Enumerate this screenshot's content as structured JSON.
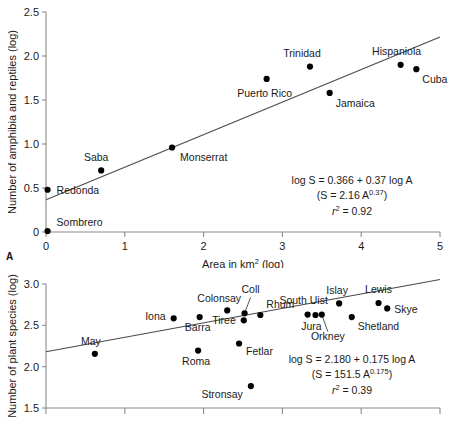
{
  "figure": {
    "panel_a_label": "A",
    "background": "#ffffff",
    "dot_color": "#000000",
    "line_color": "#4a4a4a",
    "axis_color": "#8a8a8a"
  },
  "chart_data": [
    {
      "id": "panel-a",
      "type": "scatter",
      "panel_label": "A",
      "title": "",
      "xlabel": "Area in km2 (log)",
      "xlabel_parts": {
        "pre": "Area in km",
        "sup": "2",
        "post": " (log)"
      },
      "ylabel": "Number of amphibia and reptiles (log)",
      "xlim": [
        0,
        5
      ],
      "ylim": [
        0,
        2.5
      ],
      "xticks": [
        0,
        1,
        2,
        3,
        4,
        5
      ],
      "xticklabels": [
        "0",
        "1",
        "2",
        "3",
        "4",
        "5"
      ],
      "yticks": [
        0,
        0.5,
        1.0,
        1.5,
        2.0,
        2.5
      ],
      "yticklabels": [
        "0",
        "0.5",
        "1.0",
        "1.5",
        "2.0",
        "2.5"
      ],
      "grid": false,
      "legend": "none",
      "points": [
        {
          "name": "Sombrero",
          "x": 0.02,
          "y": 0.01,
          "label_dx": 9,
          "label_dy": -5,
          "anchor": "start"
        },
        {
          "name": "Redonda",
          "x": 0.02,
          "y": 0.48,
          "label_dx": 9,
          "label_dy": 4,
          "anchor": "start"
        },
        {
          "name": "Saba",
          "x": 0.7,
          "y": 0.7,
          "label_dx": -5,
          "label_dy": -9,
          "anchor": "middle"
        },
        {
          "name": "Monserrat",
          "x": 1.6,
          "y": 0.96,
          "label_dx": 8,
          "label_dy": 13,
          "anchor": "start"
        },
        {
          "name": "Puerto Rico",
          "x": 2.8,
          "y": 1.74,
          "label_dx": -2,
          "label_dy": 18,
          "anchor": "middle"
        },
        {
          "name": "Trinidad",
          "x": 3.35,
          "y": 1.88,
          "label_dx": -8,
          "label_dy": -10,
          "anchor": "middle"
        },
        {
          "name": "Jamaica",
          "x": 3.6,
          "y": 1.58,
          "label_dx": 6,
          "label_dy": 14,
          "anchor": "start"
        },
        {
          "name": "Hispaniola",
          "x": 4.5,
          "y": 1.9,
          "label_dx": -4,
          "label_dy": -10,
          "anchor": "middle"
        },
        {
          "name": "Cuba",
          "x": 4.7,
          "y": 1.85,
          "label_dx": 6,
          "label_dy": 14,
          "anchor": "start"
        }
      ],
      "fit": {
        "equation_line1": "log S = 0.366 + 0.37 log A",
        "equation_line2_pre": "(S = 2.16 A",
        "equation_line2_sup": "0.37",
        "equation_line2_post": ")",
        "r2_label": "r",
        "r2_sup": "2",
        "r2_value": " = 0.92",
        "intercept": 0.366,
        "slope": 0.37,
        "r_squared": 0.92,
        "x_start": 0.0,
        "x_end": 5.0
      }
    },
    {
      "id": "panel-b",
      "type": "scatter",
      "panel_label": "",
      "title": "",
      "xlabel": "",
      "ylabel": "Number of plant species (log)",
      "xlim": [
        0,
        5
      ],
      "ylim": [
        1.5,
        3.0
      ],
      "xticks": [
        0,
        1,
        2,
        3,
        4,
        5
      ],
      "xticklabels": [
        "",
        "",
        "",
        "",
        "",
        ""
      ],
      "yticks": [
        1.5,
        2.0,
        2.5,
        3.0
      ],
      "yticklabels": [
        "1.5",
        "2.0",
        "2.5",
        "3.0"
      ],
      "grid": false,
      "legend": "none",
      "points": [
        {
          "name": "May",
          "x": 0.62,
          "y": 2.155,
          "label_dx": -4,
          "label_dy": -9,
          "anchor": "middle",
          "leader": false
        },
        {
          "name": "Iona",
          "x": 1.62,
          "y": 2.585,
          "label_dx": -8,
          "label_dy": 2,
          "anchor": "end",
          "leader": false
        },
        {
          "name": "Barra",
          "x": 1.95,
          "y": 2.6,
          "label_dx": -2,
          "label_dy": 14,
          "anchor": "middle",
          "leader": false
        },
        {
          "name": "Roma",
          "x": 1.93,
          "y": 2.195,
          "label_dx": -2,
          "label_dy": 14,
          "anchor": "middle",
          "leader": false
        },
        {
          "name": "Colonsay",
          "x": 2.3,
          "y": 2.68,
          "label_dx": -8,
          "label_dy": -8,
          "anchor": "middle",
          "leader": false
        },
        {
          "name": "Tiree",
          "x": 2.51,
          "y": 2.56,
          "label_dx": -8,
          "label_dy": 4,
          "anchor": "end",
          "leader": false
        },
        {
          "name": "Coll",
          "x": 2.52,
          "y": 2.645,
          "label_dx": 6,
          "label_dy": -20,
          "anchor": "middle",
          "leader": true
        },
        {
          "name": "Rhum",
          "x": 2.72,
          "y": 2.625,
          "label_dx": 6,
          "label_dy": -7,
          "anchor": "start",
          "leader": false
        },
        {
          "name": "Stronsay",
          "x": 2.6,
          "y": 1.765,
          "label_dx": -8,
          "label_dy": 12,
          "anchor": "end",
          "leader": false
        },
        {
          "name": "Fetlar",
          "x": 2.45,
          "y": 2.28,
          "label_dx": 7,
          "label_dy": 11,
          "anchor": "start",
          "leader": false
        },
        {
          "name": "South Uist",
          "x": 3.32,
          "y": 2.63,
          "label_dx": -4,
          "label_dy": -11,
          "anchor": "middle",
          "leader": false
        },
        {
          "name": "Jura",
          "x": 3.42,
          "y": 2.625,
          "label_dx": -4,
          "label_dy": 15,
          "anchor": "middle",
          "leader": false
        },
        {
          "name": "Orkney",
          "x": 3.5,
          "y": 2.63,
          "label_dx": 6,
          "label_dy": 25,
          "anchor": "middle",
          "leader": true
        },
        {
          "name": "Islay",
          "x": 3.72,
          "y": 2.765,
          "label_dx": -2,
          "label_dy": -9,
          "anchor": "middle",
          "leader": false
        },
        {
          "name": "Shetland",
          "x": 3.88,
          "y": 2.6,
          "label_dx": 6,
          "label_dy": 13,
          "anchor": "start",
          "leader": false
        },
        {
          "name": "Lewis",
          "x": 4.22,
          "y": 2.77,
          "label_dx": 0,
          "label_dy": -10,
          "anchor": "middle",
          "leader": false
        },
        {
          "name": "Skye",
          "x": 4.33,
          "y": 2.705,
          "label_dx": 7,
          "label_dy": 5,
          "anchor": "start",
          "leader": false
        }
      ],
      "fit": {
        "equation_line1": "log S = 2.180 + 0.175 log A",
        "equation_line2_pre": "(S = 151.5 A",
        "equation_line2_sup": "0.175",
        "equation_line2_post": ")",
        "r2_label": "r",
        "r2_sup": "2",
        "r2_value": " = 0.39",
        "intercept": 2.18,
        "slope": 0.175,
        "r_squared": 0.39,
        "x_start": 0.0,
        "x_end": 5.0
      }
    }
  ]
}
